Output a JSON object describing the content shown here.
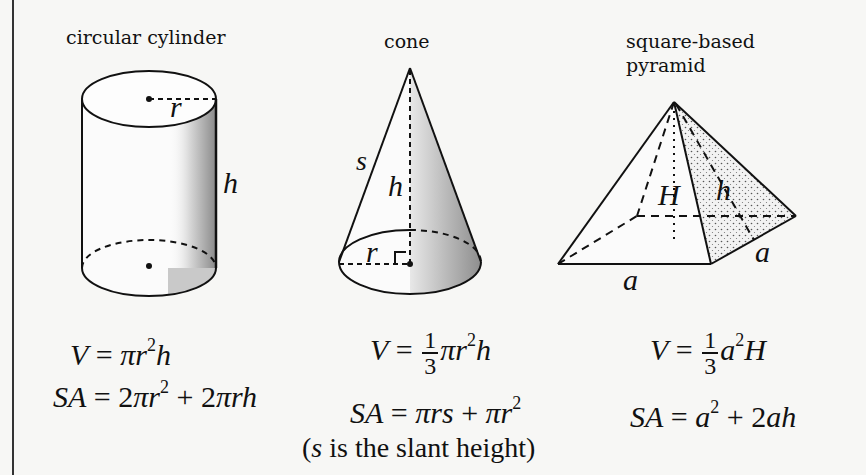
{
  "shapes": [
    {
      "name": "circular cylinder",
      "labels": {
        "radius": "r",
        "height": "h"
      },
      "volume": {
        "lhs": "V",
        "rhs": "πr²h",
        "parts": [
          "V",
          " = ",
          "π",
          "r",
          "2",
          "h"
        ]
      },
      "surface_area": {
        "lhs": "SA",
        "rhs": "2πr² + 2πrh",
        "parts": [
          "SA",
          " = 2",
          "π",
          "r",
          "2",
          " + 2",
          "πrh"
        ]
      }
    },
    {
      "name": "cone",
      "labels": {
        "slant": "s",
        "height": "h",
        "radius": "r"
      },
      "volume": {
        "lhs": "V",
        "rhs": "(1/3)πr²h",
        "parts": [
          "V",
          " = ",
          "1",
          "3",
          "π",
          "r",
          "2",
          "h"
        ]
      },
      "surface_area": {
        "lhs": "SA",
        "rhs": "πrs + πr²",
        "parts": [
          "SA",
          " = ",
          "πrs",
          " + ",
          "πr",
          "2"
        ]
      }
    },
    {
      "name": "square-based pyramid",
      "name_lines": [
        "square-based",
        "pyramid"
      ],
      "labels": {
        "height": "H",
        "slant": "h",
        "side_right": "a",
        "side_bottom": "a"
      },
      "volume": {
        "lhs": "V",
        "rhs": "(1/3)a²H",
        "parts": [
          "V",
          " = ",
          "1",
          "3",
          "a",
          "2",
          "H"
        ]
      },
      "surface_area": {
        "lhs": "SA",
        "rhs": "a² + 2ah",
        "parts": [
          "SA",
          " = ",
          "a",
          "2",
          " + 2",
          "ah"
        ]
      }
    }
  ],
  "footnote": {
    "var": "s",
    "text": " is the slant height",
    "open": "(",
    "close": ")"
  }
}
